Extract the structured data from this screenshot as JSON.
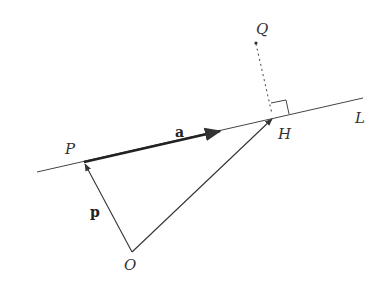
{
  "diagram": {
    "type": "vector-geometry",
    "points": {
      "P": {
        "label": "P"
      },
      "H": {
        "label": "H"
      },
      "Q": {
        "label": "Q"
      },
      "O": {
        "label": "O"
      }
    },
    "line_label": "L",
    "vectors": {
      "a": {
        "label": "a",
        "from": "P",
        "along": "L"
      },
      "p": {
        "label": "p",
        "from": "O",
        "to": "P"
      },
      "OH": {
        "from": "O",
        "to": "H"
      }
    },
    "perpendicular": {
      "from": "Q",
      "to": "H",
      "style": "dotted",
      "right_angle_mark": true
    },
    "colors": {
      "ink": "#333333",
      "background": "#ffffff"
    }
  }
}
